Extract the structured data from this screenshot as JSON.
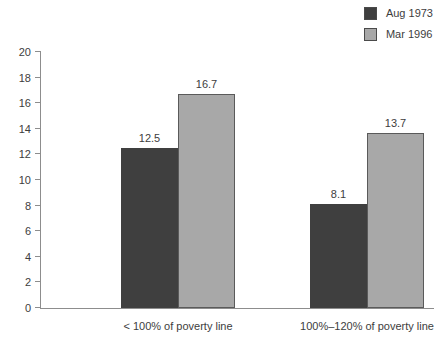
{
  "legend": {
    "position": "top-right",
    "entries": [
      {
        "label": "Aug 1973",
        "color": "#3f3f3f",
        "swatch_name": "legend-swatch-aug-1973"
      },
      {
        "label": "Mar 1996",
        "color": "#a8a8a8",
        "swatch_name": "legend-swatch-mar-1996"
      }
    ]
  },
  "chart_data": {
    "type": "bar",
    "title": "",
    "subtitle": "",
    "xlabel": "",
    "ylabel": "",
    "ylim": [
      0,
      20
    ],
    "ytick_step": 2,
    "ytick_labels": [
      "0",
      "2",
      "4",
      "6",
      "8",
      "10",
      "12",
      "14",
      "16",
      "18",
      "20"
    ],
    "grid": false,
    "legend_position": "top-right",
    "categories": [
      "< 100% of poverty line",
      "100%–120% of poverty line"
    ],
    "series": [
      {
        "name": "Aug 1973",
        "color": "#3f3f3f",
        "values": [
          12.5,
          8.1
        ],
        "labels": [
          "12.5",
          "8.1"
        ]
      },
      {
        "name": "Mar 1996",
        "color": "#a8a8a8",
        "values": [
          16.7,
          13.7
        ],
        "labels": [
          "16.7",
          "13.7"
        ]
      }
    ]
  }
}
